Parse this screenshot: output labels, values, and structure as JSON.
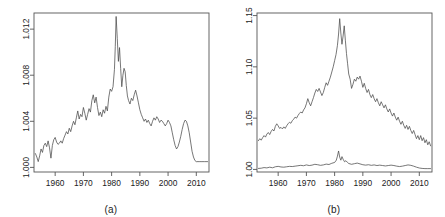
{
  "figure": {
    "background": "#ffffff",
    "line_color": "#4a4a4a",
    "axis_color": "#555555",
    "panel_count": 2
  },
  "panels": [
    {
      "id": "a",
      "caption": "(a)"
    },
    {
      "id": "b",
      "caption": "(b)"
    }
  ],
  "chart_data": [
    {
      "type": "line",
      "panel": "a",
      "title": "",
      "subtitle": "",
      "xlabel": "",
      "ylabel": "",
      "caption": "(a)",
      "xlim": [
        1952.5,
        2014.5
      ],
      "ylim": [
        0.9996,
        1.0134
      ],
      "grid": false,
      "legend": "none",
      "xticks": [
        1960,
        1970,
        1980,
        1990,
        2000,
        2010
      ],
      "xticklabels": [
        "1960",
        "1970",
        "1980",
        "1990",
        "2000",
        "2010"
      ],
      "yticks": [
        1.0,
        1.004,
        1.008,
        1.012
      ],
      "yticklabels": [
        "1.000",
        "1.004",
        "1.008",
        "1.012"
      ],
      "series": [
        {
          "name": "series-a",
          "color": "#4a4a4a",
          "x": [
            1953.0,
            1953.5,
            1954.0,
            1954.5,
            1955.0,
            1955.5,
            1956.0,
            1956.5,
            1957.0,
            1957.5,
            1958.0,
            1958.5,
            1959.0,
            1959.5,
            1960.0,
            1960.5,
            1961.0,
            1961.5,
            1962.0,
            1962.5,
            1963.0,
            1963.5,
            1964.0,
            1964.5,
            1965.0,
            1965.5,
            1966.0,
            1966.5,
            1967.0,
            1967.5,
            1968.0,
            1968.5,
            1969.0,
            1969.5,
            1970.0,
            1970.5,
            1971.0,
            1971.5,
            1972.0,
            1972.5,
            1973.0,
            1973.5,
            1974.0,
            1974.5,
            1975.0,
            1975.5,
            1976.0,
            1976.5,
            1977.0,
            1977.5,
            1978.0,
            1978.5,
            1979.0,
            1979.5,
            1980.0,
            1980.5,
            1981.0,
            1981.3,
            1981.6,
            1982.0,
            1982.4,
            1982.8,
            1983.2,
            1983.6,
            1984.0,
            1984.4,
            1984.8,
            1985.2,
            1985.6,
            1986.0,
            1986.5,
            1987.0,
            1987.5,
            1988.0,
            1988.5,
            1989.0,
            1989.5,
            1990.0,
            1990.5,
            1991.0,
            1991.5,
            1992.0,
            1992.5,
            1993.0,
            1993.5,
            1994.0,
            1994.5,
            1995.0,
            1995.5,
            1996.0,
            1996.5,
            1997.0,
            1997.5,
            1998.0,
            1998.5,
            1999.0,
            1999.5,
            2000.0,
            2000.5,
            2001.0,
            2001.5,
            2002.0,
            2002.5,
            2003.0,
            2003.5,
            2004.0,
            2004.5,
            2005.0,
            2005.5,
            2006.0,
            2006.5,
            2007.0,
            2007.5,
            2008.0,
            2008.5,
            2009.0,
            2009.5,
            2010.0,
            2011.0,
            2012.0,
            2013.0,
            2014.0
          ],
          "y": [
            1.0012,
            1.0009,
            1.0005,
            1.001,
            1.0016,
            1.0013,
            1.0019,
            1.0021,
            1.0018,
            1.0023,
            1.0017,
            1.0008,
            1.0019,
            1.0024,
            1.0026,
            1.0022,
            1.002,
            1.0021,
            1.0023,
            1.0021,
            1.0025,
            1.0028,
            1.0031,
            1.0029,
            1.0034,
            1.0031,
            1.0036,
            1.004,
            1.0037,
            1.0043,
            1.0049,
            1.0042,
            1.0046,
            1.0044,
            1.0052,
            1.0047,
            1.0041,
            1.0046,
            1.0051,
            1.0048,
            1.0058,
            1.0063,
            1.0056,
            1.0061,
            1.0052,
            1.0045,
            1.0048,
            1.0044,
            1.005,
            1.0047,
            1.0053,
            1.0049,
            1.0061,
            1.0068,
            1.0066,
            1.007,
            1.0085,
            1.0105,
            1.0131,
            1.0112,
            1.0092,
            1.0104,
            1.0086,
            1.007,
            1.008,
            1.0086,
            1.0083,
            1.0071,
            1.0062,
            1.0058,
            1.0055,
            1.006,
            1.0058,
            1.0063,
            1.0067,
            1.0062,
            1.0056,
            1.005,
            1.0046,
            1.0043,
            1.004,
            1.0042,
            1.0039,
            1.0041,
            1.0038,
            1.0036,
            1.004,
            1.0043,
            1.0041,
            1.0044,
            1.0042,
            1.0039,
            1.0041,
            1.004,
            1.0038,
            1.0036,
            1.0038,
            1.0041,
            1.0039,
            1.0036,
            1.003,
            1.0024,
            1.0019,
            1.0016,
            1.0018,
            1.0022,
            1.0027,
            1.0033,
            1.0038,
            1.0041,
            1.004,
            1.0036,
            1.003,
            1.0022,
            1.0014,
            1.0009,
            1.0006,
            1.0005,
            1.0005,
            1.0005,
            1.0005,
            1.0005,
            1.0005
          ]
        }
      ]
    },
    {
      "type": "line",
      "panel": "b",
      "title": "",
      "subtitle": "",
      "xlabel": "",
      "ylabel": "",
      "caption": "(b)",
      "xlim": [
        1952.5,
        2014.5
      ],
      "ylim": [
        0.9975,
        1.1525
      ],
      "grid": false,
      "legend": "none",
      "xticks": [
        1960,
        1970,
        1980,
        1990,
        2000,
        2010
      ],
      "xticklabels": [
        "1960",
        "1970",
        "1980",
        "1990",
        "2000",
        "2010"
      ],
      "yticks": [
        1.0,
        1.05,
        1.1,
        1.15
      ],
      "yticklabels": [
        "1.00",
        "1.05",
        "1.10",
        "1.15"
      ],
      "series": [
        {
          "name": "upper-series-b",
          "color": "#4a4a4a",
          "x": [
            1953.0,
            1953.5,
            1954.0,
            1954.5,
            1955.0,
            1955.5,
            1956.0,
            1956.5,
            1957.0,
            1957.5,
            1958.0,
            1958.5,
            1959.0,
            1959.5,
            1960.0,
            1960.5,
            1961.0,
            1961.5,
            1962.0,
            1962.5,
            1963.0,
            1963.5,
            1964.0,
            1964.5,
            1965.0,
            1965.5,
            1966.0,
            1966.5,
            1967.0,
            1967.5,
            1968.0,
            1968.5,
            1969.0,
            1969.5,
            1970.0,
            1970.5,
            1971.0,
            1971.5,
            1972.0,
            1972.5,
            1973.0,
            1973.5,
            1974.0,
            1974.5,
            1975.0,
            1975.5,
            1976.0,
            1976.5,
            1977.0,
            1977.5,
            1978.0,
            1978.5,
            1979.0,
            1979.5,
            1980.0,
            1980.5,
            1981.0,
            1981.4,
            1981.8,
            1982.2,
            1982.6,
            1983.0,
            1983.4,
            1983.8,
            1984.2,
            1984.6,
            1985.0,
            1985.5,
            1986.0,
            1986.5,
            1987.0,
            1987.5,
            1988.0,
            1988.5,
            1989.0,
            1989.5,
            1990.0,
            1990.5,
            1991.0,
            1991.5,
            1992.0,
            1992.5,
            1993.0,
            1993.5,
            1994.0,
            1994.5,
            1995.0,
            1995.5,
            1996.0,
            1996.5,
            1997.0,
            1997.5,
            1998.0,
            1998.5,
            1999.0,
            1999.5,
            2000.0,
            2000.5,
            2001.0,
            2001.5,
            2002.0,
            2002.5,
            2003.0,
            2003.5,
            2004.0,
            2004.5,
            2005.0,
            2005.5,
            2006.0,
            2006.5,
            2007.0,
            2007.5,
            2008.0,
            2008.5,
            2009.0,
            2009.5,
            2010.0,
            2010.5,
            2011.0,
            2011.5,
            2012.0,
            2012.5,
            2013.0,
            2013.5,
            2014.0
          ],
          "y": [
            1.028,
            1.03,
            1.0285,
            1.031,
            1.033,
            1.0315,
            1.0345,
            1.036,
            1.034,
            1.037,
            1.039,
            1.0375,
            1.042,
            1.0445,
            1.0425,
            1.04,
            1.041,
            1.0395,
            1.0415,
            1.04,
            1.0425,
            1.0445,
            1.046,
            1.045,
            1.0475,
            1.049,
            1.051,
            1.05,
            1.0525,
            1.0545,
            1.056,
            1.055,
            1.058,
            1.06,
            1.064,
            1.069,
            1.065,
            1.062,
            1.066,
            1.07,
            1.0745,
            1.078,
            1.076,
            1.079,
            1.0755,
            1.072,
            1.075,
            1.08,
            1.0845,
            1.082,
            1.086,
            1.09,
            1.095,
            1.1,
            1.106,
            1.112,
            1.121,
            1.132,
            1.147,
            1.133,
            1.122,
            1.13,
            1.14,
            1.126,
            1.113,
            1.103,
            1.093,
            1.088,
            1.079,
            1.083,
            1.088,
            1.086,
            1.09,
            1.088,
            1.091,
            1.086,
            1.08,
            1.084,
            1.079,
            1.075,
            1.078,
            1.073,
            1.07,
            1.073,
            1.069,
            1.066,
            1.069,
            1.065,
            1.062,
            1.066,
            1.063,
            1.06,
            1.063,
            1.059,
            1.056,
            1.059,
            1.055,
            1.052,
            1.055,
            1.051,
            1.048,
            1.051,
            1.047,
            1.044,
            1.047,
            1.043,
            1.04,
            1.043,
            1.039,
            1.042,
            1.038,
            1.035,
            1.038,
            1.034,
            1.03,
            1.033,
            1.029,
            1.033,
            1.028,
            1.031,
            1.026,
            1.029,
            1.024,
            1.027,
            1.023,
            1.034
          ]
        },
        {
          "name": "lower-series-b",
          "color": "#4a4a4a",
          "x": [
            1953.0,
            1954.0,
            1955.0,
            1956.0,
            1957.0,
            1958.0,
            1959.0,
            1960.0,
            1961.0,
            1962.0,
            1963.0,
            1964.0,
            1965.0,
            1966.0,
            1967.0,
            1968.0,
            1969.0,
            1970.0,
            1971.0,
            1972.0,
            1973.0,
            1974.0,
            1975.0,
            1976.0,
            1977.0,
            1978.0,
            1979.0,
            1980.0,
            1980.6,
            1981.0,
            1981.4,
            1981.8,
            1982.2,
            1982.6,
            1983.0,
            1983.5,
            1984.0,
            1984.5,
            1985.0,
            1986.0,
            1987.0,
            1988.0,
            1989.0,
            1990.0,
            1991.0,
            1992.0,
            1993.0,
            1994.0,
            1995.0,
            1996.0,
            1997.0,
            1998.0,
            1999.0,
            2000.0,
            2001.0,
            2002.0,
            2003.0,
            2004.0,
            2005.0,
            2006.0,
            2007.0,
            2008.0,
            2009.0,
            2010.0,
            2011.0,
            2012.0,
            2013.0,
            2014.0
          ],
          "y": [
            1.001,
            1.0012,
            1.0018,
            1.0015,
            1.0022,
            1.0016,
            1.0026,
            1.003,
            1.0024,
            1.0022,
            1.0026,
            1.003,
            1.0028,
            1.0032,
            1.0036,
            1.004,
            1.0036,
            1.0044,
            1.0038,
            1.0042,
            1.005,
            1.0046,
            1.004,
            1.0044,
            1.0052,
            1.0048,
            1.006,
            1.0068,
            1.009,
            1.013,
            1.018,
            1.012,
            1.009,
            1.0125,
            1.01,
            1.0075,
            1.0085,
            1.007,
            1.0058,
            1.005,
            1.0056,
            1.0062,
            1.0054,
            1.0046,
            1.0042,
            1.0046,
            1.004,
            1.0044,
            1.0038,
            1.0042,
            1.0038,
            1.0034,
            1.0038,
            1.0042,
            1.0038,
            1.0032,
            1.0028,
            1.0032,
            1.0038,
            1.0044,
            1.004,
            1.0032,
            1.0022,
            1.0014,
            1.001,
            1.0008,
            1.0008,
            1.0008
          ]
        }
      ]
    }
  ]
}
